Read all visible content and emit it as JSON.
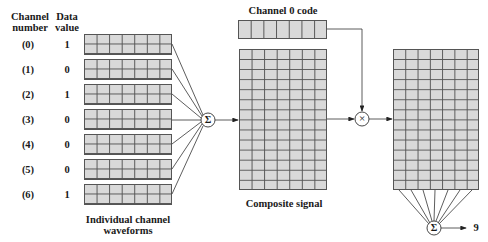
{
  "headers": {
    "channel_number": [
      "Channel",
      "number"
    ],
    "data_value": [
      "Data",
      "value"
    ]
  },
  "channels": [
    {
      "label": "(0)",
      "value": "1"
    },
    {
      "label": "(1)",
      "value": "0"
    },
    {
      "label": "(2)",
      "value": "1"
    },
    {
      "label": "(3)",
      "value": "0"
    },
    {
      "label": "(4)",
      "value": "0"
    },
    {
      "label": "(5)",
      "value": "0"
    },
    {
      "label": "(6)",
      "value": "1"
    }
  ],
  "labels": {
    "individual_waveforms": [
      "Individual channel",
      "waveforms"
    ],
    "channel0_code": "Channel 0 code",
    "composite_signal": "Composite signal",
    "output_value": "9"
  },
  "symbols": {
    "sum": "Σ",
    "multiply": "×"
  },
  "grid": {
    "channel_box": {
      "cols": 7,
      "rows": 2
    },
    "code_box": {
      "cols": 7,
      "rows": 1
    },
    "composite": {
      "cols": 7,
      "rows": 14
    },
    "product": {
      "cols": 7,
      "rows": 14
    }
  },
  "colors": {
    "cell_fill": "#d9d9d9",
    "grid_line": "#555555",
    "line": "#333333"
  }
}
